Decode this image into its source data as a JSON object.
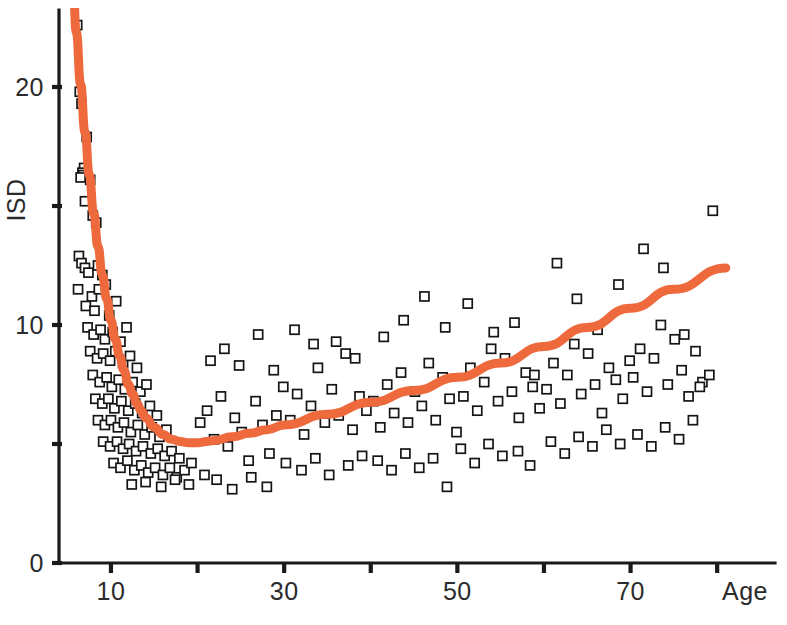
{
  "figure": {
    "width": 787,
    "height": 625,
    "background": "#ffffff"
  },
  "chart_data": {
    "type": "scatter",
    "title": "",
    "subtitle": "",
    "xlabel": "Age",
    "ylabel": "ISD",
    "xlim": [
      4,
      82
    ],
    "ylim": [
      0,
      24.5
    ],
    "grid": false,
    "legend": null,
    "x_ticks": [
      10,
      20,
      30,
      40,
      50,
      60,
      70,
      80
    ],
    "x_tick_labels": [
      "10",
      "",
      "30",
      "",
      "50",
      "",
      "70",
      ""
    ],
    "y_ticks": [
      0,
      5,
      10,
      15,
      20
    ],
    "y_tick_labels": [
      "0",
      "",
      "10",
      "",
      "20"
    ],
    "marker": {
      "shape": "open-square",
      "size_px": 9,
      "face_color": "#ffffff",
      "edge_color": "#151515"
    },
    "series": [
      {
        "name": "observations",
        "type": "scatter",
        "points": [
          [
            6.1,
            22.6
          ],
          [
            6.4,
            19.8
          ],
          [
            6.6,
            19.3
          ],
          [
            7.2,
            17.9
          ],
          [
            6.9,
            16.6
          ],
          [
            6.7,
            16.4
          ],
          [
            6.8,
            16.3
          ],
          [
            6.5,
            16.2
          ],
          [
            7.6,
            16.1
          ],
          [
            7.0,
            15.2
          ],
          [
            7.9,
            14.6
          ],
          [
            8.3,
            14.3
          ],
          [
            6.3,
            12.9
          ],
          [
            6.6,
            12.6
          ],
          [
            7.0,
            12.4
          ],
          [
            7.4,
            12.2
          ],
          [
            8.5,
            12.5
          ],
          [
            9.0,
            12.1
          ],
          [
            6.2,
            11.5
          ],
          [
            7.8,
            11.2
          ],
          [
            8.6,
            11.5
          ],
          [
            9.4,
            11.7
          ],
          [
            7.1,
            10.8
          ],
          [
            8.1,
            10.6
          ],
          [
            9.8,
            10.4
          ],
          [
            10.6,
            11.0
          ],
          [
            7.3,
            9.9
          ],
          [
            8.0,
            9.6
          ],
          [
            8.8,
            9.8
          ],
          [
            9.3,
            9.4
          ],
          [
            10.2,
            9.7
          ],
          [
            11.1,
            9.3
          ],
          [
            11.8,
            9.9
          ],
          [
            7.6,
            8.9
          ],
          [
            8.4,
            8.6
          ],
          [
            9.1,
            8.8
          ],
          [
            9.9,
            8.5
          ],
          [
            10.5,
            8.9
          ],
          [
            11.4,
            8.4
          ],
          [
            12.2,
            8.7
          ],
          [
            13.0,
            8.2
          ],
          [
            7.9,
            7.9
          ],
          [
            8.7,
            7.6
          ],
          [
            9.5,
            7.8
          ],
          [
            10.1,
            7.4
          ],
          [
            10.9,
            7.7
          ],
          [
            11.6,
            7.3
          ],
          [
            12.5,
            7.6
          ],
          [
            13.4,
            7.2
          ],
          [
            14.1,
            7.5
          ],
          [
            8.2,
            6.9
          ],
          [
            9.0,
            6.7
          ],
          [
            9.7,
            6.9
          ],
          [
            10.4,
            6.5
          ],
          [
            11.2,
            6.8
          ],
          [
            12.0,
            6.4
          ],
          [
            12.8,
            6.7
          ],
          [
            13.6,
            6.3
          ],
          [
            14.5,
            6.6
          ],
          [
            15.3,
            6.2
          ],
          [
            8.5,
            6.0
          ],
          [
            9.3,
            5.8
          ],
          [
            10.0,
            6.0
          ],
          [
            10.8,
            5.7
          ],
          [
            11.5,
            5.9
          ],
          [
            12.3,
            5.5
          ],
          [
            13.1,
            5.8
          ],
          [
            13.9,
            5.4
          ],
          [
            14.7,
            5.7
          ],
          [
            15.6,
            5.3
          ],
          [
            16.4,
            5.6
          ],
          [
            9.1,
            5.1
          ],
          [
            9.9,
            4.9
          ],
          [
            10.7,
            5.1
          ],
          [
            11.4,
            4.8
          ],
          [
            12.1,
            5.0
          ],
          [
            12.9,
            4.7
          ],
          [
            13.7,
            4.9
          ],
          [
            14.6,
            4.6
          ],
          [
            15.4,
            4.8
          ],
          [
            16.2,
            4.5
          ],
          [
            17.0,
            4.7
          ],
          [
            17.9,
            4.4
          ],
          [
            10.3,
            4.2
          ],
          [
            11.1,
            4.0
          ],
          [
            11.9,
            4.3
          ],
          [
            12.7,
            3.9
          ],
          [
            13.5,
            4.1
          ],
          [
            14.3,
            3.8
          ],
          [
            15.1,
            4.0
          ],
          [
            16.0,
            3.7
          ],
          [
            16.8,
            4.0
          ],
          [
            17.6,
            3.6
          ],
          [
            18.5,
            3.9
          ],
          [
            19.3,
            4.2
          ],
          [
            12.4,
            3.3
          ],
          [
            14.0,
            3.4
          ],
          [
            15.8,
            3.2
          ],
          [
            17.4,
            3.5
          ],
          [
            19.0,
            3.3
          ],
          [
            20.3,
            5.9
          ],
          [
            21.1,
            6.4
          ],
          [
            21.9,
            5.2
          ],
          [
            22.7,
            7.0
          ],
          [
            23.5,
            4.9
          ],
          [
            24.3,
            6.1
          ],
          [
            25.1,
            5.5
          ],
          [
            25.9,
            4.3
          ],
          [
            26.7,
            6.8
          ],
          [
            27.5,
            5.8
          ],
          [
            28.3,
            4.6
          ],
          [
            29.1,
            6.2
          ],
          [
            29.9,
            7.4
          ],
          [
            20.8,
            3.7
          ],
          [
            22.2,
            3.5
          ],
          [
            24.0,
            3.1
          ],
          [
            26.2,
            3.6
          ],
          [
            28.0,
            3.2
          ],
          [
            21.5,
            8.5
          ],
          [
            23.1,
            9.0
          ],
          [
            24.8,
            8.3
          ],
          [
            27.0,
            9.6
          ],
          [
            28.8,
            8.1
          ],
          [
            30.7,
            6.0
          ],
          [
            31.5,
            7.1
          ],
          [
            32.3,
            5.4
          ],
          [
            33.1,
            6.6
          ],
          [
            33.9,
            8.2
          ],
          [
            34.7,
            5.9
          ],
          [
            35.5,
            7.3
          ],
          [
            36.3,
            6.2
          ],
          [
            37.1,
            8.8
          ],
          [
            37.9,
            5.6
          ],
          [
            38.7,
            7.0
          ],
          [
            39.5,
            6.4
          ],
          [
            30.2,
            4.2
          ],
          [
            32.0,
            3.9
          ],
          [
            33.6,
            4.4
          ],
          [
            35.2,
            3.7
          ],
          [
            37.4,
            4.1
          ],
          [
            39.0,
            4.5
          ],
          [
            31.2,
            9.8
          ],
          [
            33.4,
            9.2
          ],
          [
            36.0,
            9.3
          ],
          [
            38.2,
            8.6
          ],
          [
            40.3,
            6.8
          ],
          [
            41.1,
            5.7
          ],
          [
            41.9,
            7.5
          ],
          [
            42.7,
            6.3
          ],
          [
            43.5,
            8.0
          ],
          [
            44.3,
            5.9
          ],
          [
            45.1,
            7.2
          ],
          [
            45.9,
            6.6
          ],
          [
            46.7,
            8.4
          ],
          [
            47.5,
            6.0
          ],
          [
            48.3,
            7.8
          ],
          [
            49.1,
            6.9
          ],
          [
            49.9,
            5.5
          ],
          [
            40.8,
            4.3
          ],
          [
            42.4,
            3.9
          ],
          [
            44.0,
            4.6
          ],
          [
            45.6,
            4.0
          ],
          [
            47.2,
            4.4
          ],
          [
            48.8,
            3.2
          ],
          [
            41.5,
            9.5
          ],
          [
            43.8,
            10.2
          ],
          [
            46.2,
            11.2
          ],
          [
            48.6,
            9.9
          ],
          [
            50.7,
            7.0
          ],
          [
            51.5,
            8.2
          ],
          [
            52.3,
            6.4
          ],
          [
            53.1,
            7.6
          ],
          [
            53.9,
            9.0
          ],
          [
            54.7,
            6.8
          ],
          [
            55.5,
            8.6
          ],
          [
            56.3,
            7.2
          ],
          [
            57.1,
            6.1
          ],
          [
            57.9,
            8.0
          ],
          [
            58.7,
            7.4
          ],
          [
            59.5,
            6.5
          ],
          [
            50.4,
            4.8
          ],
          [
            52.0,
            4.2
          ],
          [
            53.6,
            5.0
          ],
          [
            55.2,
            4.5
          ],
          [
            57.0,
            4.7
          ],
          [
            58.4,
            4.1
          ],
          [
            51.2,
            10.9
          ],
          [
            54.2,
            9.7
          ],
          [
            56.6,
            10.1
          ],
          [
            58.9,
            7.9
          ],
          [
            60.3,
            7.3
          ],
          [
            61.1,
            8.4
          ],
          [
            61.9,
            6.7
          ],
          [
            62.7,
            7.9
          ],
          [
            63.5,
            9.2
          ],
          [
            64.3,
            7.1
          ],
          [
            65.1,
            8.8
          ],
          [
            65.9,
            7.5
          ],
          [
            66.7,
            6.3
          ],
          [
            67.5,
            8.2
          ],
          [
            68.3,
            7.7
          ],
          [
            69.1,
            6.9
          ],
          [
            69.9,
            8.5
          ],
          [
            60.8,
            5.1
          ],
          [
            62.4,
            4.6
          ],
          [
            64.0,
            5.3
          ],
          [
            65.6,
            4.9
          ],
          [
            67.2,
            5.6
          ],
          [
            68.8,
            5.0
          ],
          [
            61.5,
            12.6
          ],
          [
            63.8,
            11.1
          ],
          [
            66.2,
            9.8
          ],
          [
            68.6,
            11.7
          ],
          [
            70.3,
            7.8
          ],
          [
            71.1,
            9.0
          ],
          [
            71.9,
            7.2
          ],
          [
            72.7,
            8.6
          ],
          [
            73.5,
            10.0
          ],
          [
            74.3,
            7.5
          ],
          [
            75.1,
            9.4
          ],
          [
            75.9,
            8.1
          ],
          [
            76.7,
            7.0
          ],
          [
            77.5,
            8.9
          ],
          [
            78.3,
            7.6
          ],
          [
            79.1,
            7.9
          ],
          [
            70.8,
            5.4
          ],
          [
            72.4,
            4.9
          ],
          [
            74.0,
            5.7
          ],
          [
            75.6,
            5.2
          ],
          [
            77.2,
            6.0
          ],
          [
            71.5,
            13.2
          ],
          [
            73.8,
            12.4
          ],
          [
            79.5,
            14.8
          ],
          [
            78.0,
            7.4
          ],
          [
            76.2,
            9.6
          ]
        ]
      }
    ],
    "fit_curve": {
      "name": "fitted-curve",
      "color": "#ee6a3c",
      "line_width_px": 9,
      "description": "U-shaped fit: steep decline from infancy to a minimum near age 20, then gradual rise with age",
      "points": [
        [
          5.6,
          24.4
        ],
        [
          6.0,
          22.3
        ],
        [
          6.5,
          20.1
        ],
        [
          7.0,
          18.1
        ],
        [
          7.5,
          16.3
        ],
        [
          8.0,
          14.7
        ],
        [
          8.5,
          13.3
        ],
        [
          9.0,
          12.1
        ],
        [
          9.5,
          11.1
        ],
        [
          10.0,
          10.2
        ],
        [
          10.5,
          9.4
        ],
        [
          11.0,
          8.7
        ],
        [
          11.5,
          8.1
        ],
        [
          12.0,
          7.5
        ],
        [
          12.5,
          7.1
        ],
        [
          13.0,
          6.7
        ],
        [
          13.5,
          6.4
        ],
        [
          14.0,
          6.1
        ],
        [
          15.0,
          5.7
        ],
        [
          16.0,
          5.4
        ],
        [
          17.0,
          5.2
        ],
        [
          18.0,
          5.1
        ],
        [
          19.0,
          5.05
        ],
        [
          20.0,
          5.05
        ],
        [
          21.0,
          5.1
        ],
        [
          22.0,
          5.15
        ],
        [
          24.0,
          5.3
        ],
        [
          26.0,
          5.45
        ],
        [
          28.0,
          5.6
        ],
        [
          30.0,
          5.8
        ],
        [
          35.0,
          6.25
        ],
        [
          40.0,
          6.75
        ],
        [
          45.0,
          7.25
        ],
        [
          50.0,
          7.8
        ],
        [
          55.0,
          8.4
        ],
        [
          60.0,
          9.1
        ],
        [
          65.0,
          9.9
        ],
        [
          70.0,
          10.7
        ],
        [
          75.0,
          11.5
        ],
        [
          81.0,
          12.4
        ]
      ]
    }
  },
  "axes": {
    "y_axis_title": "ISD",
    "x_axis_title": "Age",
    "axis_color": "#1a1a1a"
  },
  "colors": {
    "curve": "#ee6a3c",
    "marker_edge": "#151515",
    "marker_face": "#ffffff",
    "axis": "#1a1a1a",
    "text": "#2b2b2b",
    "background": "#ffffff"
  }
}
